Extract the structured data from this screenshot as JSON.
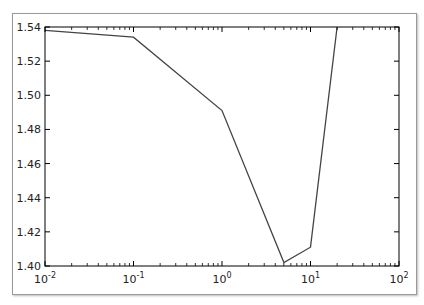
{
  "chart_data": {
    "type": "line",
    "title": "",
    "xlabel": "",
    "ylabel": "",
    "xscale": "log",
    "xlim": [
      0.01,
      100
    ],
    "ylim": [
      1.4,
      1.54
    ],
    "grid": false,
    "legend": null,
    "x_ticks": [
      "10^-2",
      "10^-1",
      "10^0",
      "10^1",
      "10^2"
    ],
    "y_ticks": [
      "1.40",
      "1.42",
      "1.44",
      "1.46",
      "1.48",
      "1.50",
      "1.52",
      "1.54"
    ],
    "series": [
      {
        "name": "series-1",
        "color": "#444444",
        "x": [
          0.01,
          0.1,
          1,
          5,
          10,
          20
        ],
        "y": [
          1.538,
          1.534,
          1.491,
          1.402,
          1.411,
          1.54
        ]
      }
    ]
  },
  "colors": {
    "line": "#444444",
    "axes": "#000000",
    "background": "#ffffff"
  }
}
